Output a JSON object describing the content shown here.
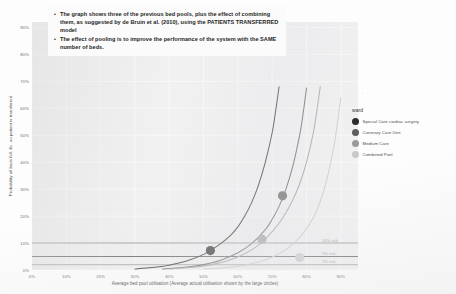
{
  "callout": {
    "bullets": [
      "The graph shows three of the previous bed pools, plus the effect of combining them, as suggested by de Bruin et al. (2010), using the PATIENTS TRANSFERRED model",
      "The effect of pooling is to improve the performance of the system with the SAME number of beds."
    ]
  },
  "legend": {
    "title": "ward",
    "items": [
      {
        "label": "Special Care cardiac surgery",
        "color": "#2b2b2b"
      },
      {
        "label": "Coronary Care Unit",
        "color": "#5d5d5d"
      },
      {
        "label": "Medium Care",
        "color": "#9a9a9a"
      },
      {
        "label": "Combined Pool",
        "color": "#c8c8c8"
      }
    ]
  },
  "annotations": [
    {
      "text": "10% risk",
      "value": 10
    },
    {
      "text": "5% risk",
      "value": 5
    },
    {
      "text": "2% risk",
      "value": 2
    }
  ],
  "chart_data": {
    "type": "line",
    "title": "",
    "xlabel": "Average bed pool utilisation (Average actual utilisation shown by the large circles)",
    "ylabel": "Probability all beds full, &c. so patient is transferred",
    "xlim": [
      0,
      95
    ],
    "ylim": [
      0,
      92
    ],
    "xticks": [
      "0%",
      "10%",
      "20%",
      "30%",
      "40%",
      "50%",
      "60%",
      "70%",
      "80%",
      "90%"
    ],
    "xtick_values": [
      0,
      10,
      20,
      30,
      40,
      50,
      60,
      70,
      80,
      90
    ],
    "yticks": [
      "0%",
      "10%",
      "20%",
      "30%",
      "40%",
      "50%",
      "60%",
      "70%",
      "80%",
      "90%"
    ],
    "ytick_values": [
      0,
      10,
      20,
      30,
      40,
      50,
      60,
      70,
      80,
      90
    ],
    "grid": true,
    "legend_position": "right",
    "reference_lines": [
      {
        "label": "10% risk",
        "y": 10,
        "color": "#8e8e8e"
      },
      {
        "label": "5% risk",
        "y": 5,
        "color": "#5a5a5a"
      },
      {
        "label": "2% risk",
        "y": 2,
        "color": "#b0b0b0"
      }
    ],
    "series": [
      {
        "name": "Special Care cardiac surgery",
        "color": "#2b2b2b",
        "x": [
          30,
          35,
          40,
          45,
          50,
          55,
          58,
          60,
          62,
          64,
          66,
          68,
          70,
          71,
          72
        ],
        "y": [
          0.4,
          0.9,
          1.8,
          3.3,
          5.8,
          9.8,
          13.0,
          16.0,
          20.0,
          25.0,
          31.5,
          40.0,
          51.0,
          59.0,
          68.0
        ],
        "marker": {
          "x": 52,
          "y": 7.2,
          "size": 4.6
        }
      },
      {
        "name": "Coronary Care Unit",
        "color": "#5d5d5d",
        "x": [
          38,
          44,
          50,
          55,
          60,
          64,
          68,
          70,
          72,
          74,
          76,
          78,
          79,
          80
        ],
        "y": [
          0.4,
          0.9,
          2.0,
          3.6,
          6.4,
          9.8,
          15.0,
          18.8,
          23.6,
          30.0,
          38.5,
          50.0,
          58.0,
          67.5
        ],
        "marker": {
          "x": 73,
          "y": 27.5,
          "size": 4.6
        }
      },
      {
        "name": "Medium Care",
        "color": "#9a9a9a",
        "x": [
          40,
          46,
          52,
          57,
          62,
          66,
          70,
          73,
          76,
          78,
          80,
          82,
          83,
          84
        ],
        "y": [
          0.4,
          0.9,
          1.9,
          3.4,
          6.0,
          9.2,
          14.2,
          19.2,
          26.0,
          32.0,
          40.0,
          51.0,
          59.0,
          68.0
        ],
        "marker": {
          "x": 67,
          "y": 11.4,
          "size": 4.6
        }
      },
      {
        "name": "Combined Pool",
        "color": "#c8c8c8",
        "x": [
          50,
          56,
          62,
          67,
          72,
          76,
          79,
          82,
          84,
          86,
          88,
          89,
          90
        ],
        "y": [
          0.35,
          0.8,
          1.8,
          3.3,
          6.0,
          9.6,
          13.6,
          19.5,
          25.5,
          34.0,
          46.0,
          54.5,
          64.0
        ],
        "marker": {
          "x": 78,
          "y": 4.6,
          "size": 4.6
        }
      }
    ]
  }
}
